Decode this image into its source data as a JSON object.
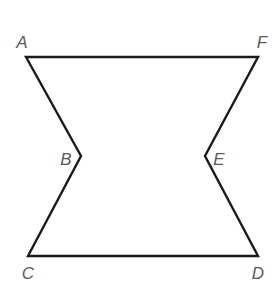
{
  "figure": {
    "stroke_color": "#1a1a1a",
    "label_color": "#5a5a5a",
    "vertices": [
      {
        "name": "A",
        "x": 26,
        "y": 57
      },
      {
        "name": "B",
        "x": 81,
        "y": 156
      },
      {
        "name": "C",
        "x": 28,
        "y": 256
      },
      {
        "name": "D",
        "x": 258,
        "y": 256
      },
      {
        "name": "E",
        "x": 205,
        "y": 156
      },
      {
        "name": "F",
        "x": 258,
        "y": 57
      }
    ],
    "labels": {
      "A": "A",
      "B": "B",
      "C": "C",
      "D": "D",
      "E": "E",
      "F": "F"
    }
  }
}
